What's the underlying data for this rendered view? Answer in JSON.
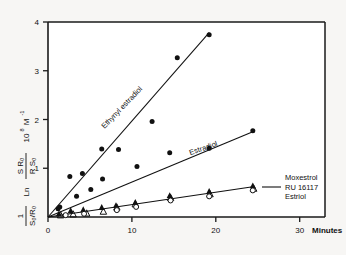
{
  "chart_data": {
    "type": "scatter",
    "title": "",
    "subtitle": "",
    "xlabel": "Minutes",
    "ylabel": "1/(S0/R0) Ln (S R0)/(R S0)   10^8 M^-1",
    "ylabel_parts": {
      "prefix_numerator": "1",
      "prefix_denominator": "S₀/R₀",
      "ln": "Ln",
      "frac_numerator": "S R₀",
      "frac_denominator": "R S₀",
      "units_base": "10",
      "units_exp": "8",
      "units_tail": "M",
      "units_tail_exp": "-1"
    },
    "xlim": [
      0,
      33
    ],
    "ylim": [
      0,
      4.25
    ],
    "xticks": [
      0,
      10,
      20,
      30
    ],
    "xtick_labels": [
      "0",
      "10",
      "20",
      "30"
    ],
    "yticks": [
      1,
      2,
      3,
      4
    ],
    "ytick_labels": [
      "1",
      "2",
      "3",
      "4"
    ],
    "grid": false,
    "legend": "inline-annotations",
    "series": [
      {
        "name": "Ethynyl estradiol",
        "label": "Ethynyl estradiol",
        "marker": "filled-circle",
        "color": "#111111",
        "fit_line": {
          "x0": 0,
          "y0": 0,
          "x1": 19.2,
          "y1": 4.02
        },
        "label_position": {
          "x": 9.0,
          "y": 2.35,
          "rotation": -46
        },
        "points": [
          {
            "x": 1.2,
            "y": 0.18
          },
          {
            "x": 2.6,
            "y": 0.88
          },
          {
            "x": 4.1,
            "y": 0.95
          },
          {
            "x": 6.4,
            "y": 1.48
          },
          {
            "x": 8.4,
            "y": 1.47
          },
          {
            "x": 12.4,
            "y": 2.08
          },
          {
            "x": 15.4,
            "y": 3.47
          },
          {
            "x": 19.2,
            "y": 3.97
          }
        ]
      },
      {
        "name": "Estradiol",
        "label": "Estradiol",
        "marker": "filled-circle",
        "color": "#111111",
        "fit_line": {
          "x0": 0,
          "y0": 0,
          "x1": 24.4,
          "y1": 1.86
        },
        "label_position": {
          "x": 18.6,
          "y": 1.45,
          "rotation": -19
        },
        "points": [
          {
            "x": 1.4,
            "y": 0.22
          },
          {
            "x": 3.4,
            "y": 0.45
          },
          {
            "x": 5.1,
            "y": 0.6
          },
          {
            "x": 6.5,
            "y": 0.83
          },
          {
            "x": 10.6,
            "y": 1.1
          },
          {
            "x": 14.5,
            "y": 1.4
          },
          {
            "x": 19.2,
            "y": 1.5
          },
          {
            "x": 24.4,
            "y": 1.88
          }
        ]
      },
      {
        "name": "Moxestrol",
        "label": "Moxestrol",
        "marker": "filled-triangle",
        "color": "#111111",
        "fit_line": {
          "x0": 0,
          "y0": 0,
          "x1": 24.4,
          "y1": 0.66
        },
        "points": [
          {
            "x": 1.3,
            "y": 0.07
          },
          {
            "x": 2.7,
            "y": 0.14
          },
          {
            "x": 4.2,
            "y": 0.16
          },
          {
            "x": 6.4,
            "y": 0.21
          },
          {
            "x": 8.1,
            "y": 0.25
          },
          {
            "x": 10.4,
            "y": 0.32
          },
          {
            "x": 14.5,
            "y": 0.47
          },
          {
            "x": 19.2,
            "y": 0.56
          },
          {
            "x": 24.4,
            "y": 0.68
          }
        ]
      },
      {
        "name": "RU 16117",
        "label": "RU 16117",
        "marker": "open-triangle",
        "color": "#111111",
        "points": [
          {
            "x": 1.5,
            "y": 0.04
          },
          {
            "x": 3.0,
            "y": 0.06
          },
          {
            "x": 4.6,
            "y": 0.08
          },
          {
            "x": 6.6,
            "y": 0.12
          },
          {
            "x": 8.2,
            "y": 0.21
          },
          {
            "x": 10.4,
            "y": 0.28
          },
          {
            "x": 14.6,
            "y": 0.42
          },
          {
            "x": 19.3,
            "y": 0.5
          },
          {
            "x": 24.5,
            "y": 0.62
          }
        ]
      },
      {
        "name": "Estriol",
        "label": "Estriol",
        "marker": "open-circle",
        "color": "#111111",
        "points": [
          {
            "x": 2.1,
            "y": 0.04
          },
          {
            "x": 4.3,
            "y": 0.07
          },
          {
            "x": 8.2,
            "y": 0.15
          },
          {
            "x": 10.5,
            "y": 0.22
          },
          {
            "x": 14.6,
            "y": 0.36
          },
          {
            "x": 19.2,
            "y": 0.45
          },
          {
            "x": 24.4,
            "y": 0.58
          }
        ]
      }
    ],
    "group_annotation": {
      "lines": [
        "Moxestrol",
        "RU 16117",
        "Estriol"
      ],
      "anchor_x": 24.9,
      "anchor_y": 0.62
    }
  }
}
